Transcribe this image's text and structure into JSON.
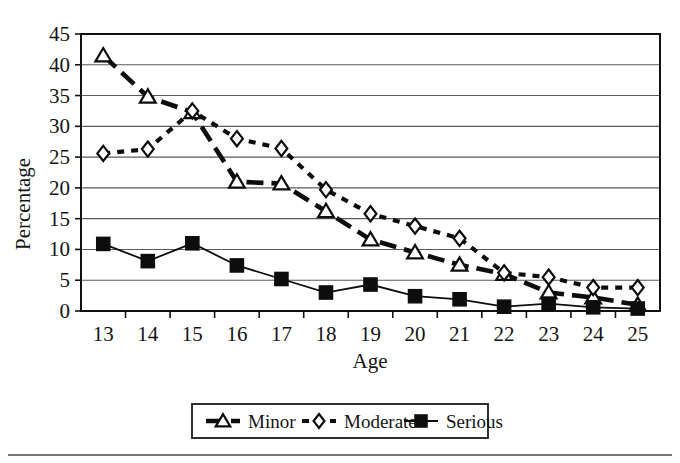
{
  "chart_data": {
    "type": "line",
    "title": "",
    "xlabel": "Age",
    "ylabel": "Percentage",
    "categories": [
      13,
      14,
      15,
      16,
      17,
      18,
      19,
      20,
      21,
      22,
      23,
      24,
      25
    ],
    "x": [
      13,
      14,
      15,
      16,
      17,
      18,
      19,
      20,
      21,
      22,
      23,
      24,
      25
    ],
    "xlim": [
      12.5,
      25.5
    ],
    "ylim": [
      0,
      45
    ],
    "xticks": [
      "13",
      "14",
      "15",
      "16",
      "17",
      "18",
      "19",
      "20",
      "21",
      "22",
      "23",
      "24",
      "25"
    ],
    "yticks": [
      "0",
      "5",
      "10",
      "15",
      "20",
      "25",
      "30",
      "35",
      "40",
      "45"
    ],
    "ytick_step": 5,
    "grid": "horizontal",
    "legend_position": "below-plot",
    "series": [
      {
        "name": "Minor",
        "marker": "open-triangle",
        "line": "long-dash",
        "values": [
          41.5,
          34.8,
          32.3,
          21.0,
          20.7,
          16.2,
          11.6,
          9.5,
          7.5,
          6.0,
          3.0,
          2.2,
          1.0
        ]
      },
      {
        "name": "Moderate",
        "marker": "open-diamond",
        "line": "dotted",
        "values": [
          25.6,
          26.3,
          32.5,
          28.0,
          26.4,
          19.7,
          15.8,
          13.8,
          11.8,
          6.2,
          5.5,
          3.8,
          3.8
        ]
      },
      {
        "name": "Serious",
        "marker": "filled-square",
        "line": "solid",
        "values": [
          10.9,
          8.1,
          11.0,
          7.4,
          5.2,
          3.0,
          4.3,
          2.4,
          1.9,
          0.7,
          1.2,
          0.6,
          0.4
        ]
      }
    ]
  },
  "axes": {
    "y_title": "Percentage",
    "x_title": "Age"
  },
  "legend": {
    "items": [
      {
        "label": "Minor",
        "marker": "open-triangle"
      },
      {
        "label": "Moderate",
        "marker": "open-diamond"
      },
      {
        "label": "Serious",
        "marker": "filled-square"
      }
    ]
  }
}
